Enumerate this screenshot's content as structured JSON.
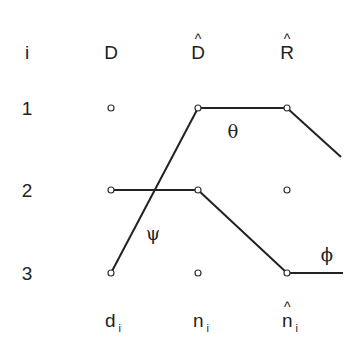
{
  "header": {
    "index_label": "i",
    "columns": [
      "D",
      "D",
      "R"
    ],
    "column_hats": [
      false,
      true,
      true
    ]
  },
  "rows": [
    "1",
    "2",
    "3"
  ],
  "footer": {
    "labels": [
      {
        "base": "d",
        "sub": "i",
        "hat": false
      },
      {
        "base": "n",
        "sub": "i",
        "hat": false
      },
      {
        "base": "n",
        "sub": "i",
        "hat": true
      }
    ]
  },
  "annotations": {
    "theta": "θ",
    "psi": "ψ",
    "phi": "ϕ"
  },
  "nodes": {
    "col_x": [
      111,
      198,
      287
    ],
    "row_y": [
      108,
      190,
      273
    ]
  },
  "edges": [
    {
      "from": [
        111,
        273
      ],
      "to": [
        198,
        108
      ],
      "label": "psi"
    },
    {
      "from": [
        198,
        108
      ],
      "to": [
        287,
        108
      ],
      "label": "theta"
    },
    {
      "from": [
        287,
        108
      ],
      "to": [
        341,
        157
      ],
      "label": "theta"
    },
    {
      "from": [
        111,
        190
      ],
      "to": [
        198,
        190
      ],
      "label": "phi"
    },
    {
      "from": [
        198,
        190
      ],
      "to": [
        287,
        273
      ],
      "label": "phi"
    },
    {
      "from": [
        287,
        273
      ],
      "to": [
        343,
        273
      ],
      "label": "phi"
    }
  ]
}
